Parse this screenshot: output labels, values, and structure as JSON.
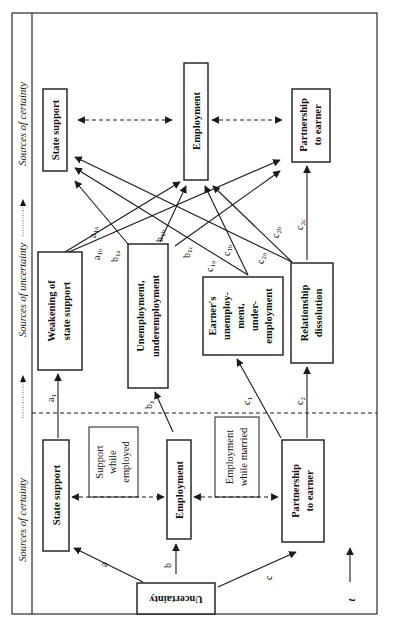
{
  "diagram": {
    "orientation": "rotated-90-ccw",
    "bands": {
      "certainty_left": "Sources of certainty",
      "uncertainty": "Sources of uncertainty",
      "certainty_right": "Sources of certainty"
    },
    "boxes": {
      "uncertainty": "Uncertainty",
      "state_support_1": "State support",
      "employment_1": "Employment",
      "partnership_1": [
        "Partnership",
        "to earner"
      ],
      "support_while_employed": [
        "Support",
        "while",
        "employed"
      ],
      "employment_while_married": [
        "Employment",
        "while married"
      ],
      "weakening": [
        "Weakening of",
        "state support"
      ],
      "unemployment": [
        "Unemployment,",
        "underemployment"
      ],
      "earners_unemployment": [
        "Earner's",
        "unemploy-",
        "ment,",
        "under-",
        "employment"
      ],
      "relationship_dissolution": [
        "Relationship",
        "dissolution"
      ],
      "state_support_2": "State support",
      "employment_2": "Employment",
      "partnership_2": [
        "Partnership",
        "to earner"
      ]
    },
    "edge_labels": {
      "a": {
        "base": "a",
        "sub": ""
      },
      "b": {
        "base": "b",
        "sub": ""
      },
      "c": {
        "base": "c",
        "sub": ""
      },
      "a1": {
        "base": "a",
        "sub": "1"
      },
      "b1": {
        "base": "b",
        "sub": "1"
      },
      "c1": {
        "base": "c",
        "sub": "1"
      },
      "c2": {
        "base": "c",
        "sub": "2"
      },
      "a1a": {
        "base": "a",
        "sub": "1a"
      },
      "a1b": {
        "base": "a",
        "sub": "1b"
      },
      "b1a": {
        "base": "b",
        "sub": "1a"
      },
      "b1b": {
        "base": "b",
        "sub": "1b"
      },
      "b1c": {
        "base": "b",
        "sub": "1c"
      },
      "c1a": {
        "base": "c",
        "sub": "1a"
      },
      "c1b": {
        "base": "c",
        "sub": "1b"
      },
      "c2a": {
        "base": "c",
        "sub": "2a"
      },
      "c2b": {
        "base": "c",
        "sub": "2b"
      },
      "c2c": {
        "base": "c",
        "sub": "2c"
      }
    },
    "time_axis": "t"
  }
}
